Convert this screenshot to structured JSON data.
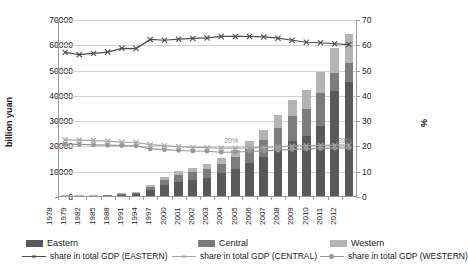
{
  "chart_data": {
    "type": "bar",
    "subtype": "stacked-bar-with-lines",
    "title": "",
    "xlabel": "",
    "ylabel": "billion yuan",
    "ylabel_secondary": "%",
    "ylim": [
      0,
      70000
    ],
    "yticks": [
      0,
      10000,
      20000,
      30000,
      40000,
      50000,
      60000,
      70000
    ],
    "ylim_secondary": [
      0,
      70
    ],
    "yticks_secondary": [
      0,
      10,
      20,
      30,
      40,
      50,
      60,
      70
    ],
    "grid": true,
    "legend_position": "bottom",
    "categories": [
      "1978",
      "1979",
      "1982",
      "1985",
      "1988",
      "1991",
      "1994",
      "1997",
      "2000",
      "2001",
      "2002",
      "2003",
      "2004",
      "2005",
      "2006",
      "2007",
      "2008",
      "2009",
      "2010",
      "2011",
      "2012"
    ],
    "series": [
      {
        "name": "Eastern",
        "kind": "bar",
        "axis": "left",
        "color": "#595959",
        "values": [
          170,
          190,
          260,
          430,
          800,
          1150,
          2800,
          4600,
          6100,
          6800,
          7700,
          9300,
          11100,
          13300,
          15800,
          19000,
          22000,
          24000,
          28000,
          42000,
          45500
        ]
      },
      {
        "name": "Central",
        "kind": "bar",
        "axis": "left",
        "color": "#7c7c7c",
        "values": [
          90,
          100,
          140,
          230,
          430,
          600,
          1300,
          2000,
          2600,
          2900,
          3200,
          3800,
          4600,
          5500,
          6600,
          8200,
          9900,
          11000,
          13000,
          7000,
          7500
        ]
      },
      {
        "name": "Western",
        "kind": "bar",
        "axis": "left",
        "color": "#b4b4b4",
        "values": [
          60,
          70,
          95,
          150,
          280,
          400,
          800,
          1250,
          1600,
          1800,
          2000,
          2400,
          2900,
          3500,
          4200,
          5200,
          6300,
          7200,
          8500,
          10000,
          11500
        ]
      },
      {
        "name": "share in total GDP (EASTERN)",
        "kind": "line",
        "axis": "right",
        "color": "#4d4d4d",
        "marker": "x",
        "values": [
          57.2,
          56.3,
          56.8,
          57.3,
          58.8,
          58.7,
          62.3,
          62.0,
          62.4,
          62.7,
          62.9,
          63.5,
          63.5,
          63.5,
          63.3,
          62.8,
          62.0,
          61.2,
          61.0,
          60.6,
          60.3
        ]
      },
      {
        "name": "share in total GDP (CENTRAL)",
        "kind": "line",
        "axis": "right",
        "color": "#a5a5a5",
        "marker": "x",
        "values": [
          22.6,
          22.5,
          22.3,
          22.1,
          21.7,
          21.6,
          20.7,
          20.3,
          19.9,
          19.6,
          19.5,
          19.3,
          19.3,
          19.4,
          19.6,
          19.8,
          20.1,
          20.3,
          20.4,
          20.5,
          20.6
        ]
      },
      {
        "name": "share in total GDP (WESTERN)",
        "kind": "line",
        "axis": "right",
        "color": "#969696",
        "marker": "circle",
        "values": [
          20.9,
          20.8,
          20.6,
          20.5,
          20.3,
          20.2,
          19.0,
          18.7,
          18.4,
          18.2,
          18.1,
          17.7,
          17.8,
          18.0,
          18.2,
          18.5,
          18.8,
          19.0,
          19.2,
          19.3,
          19.4
        ]
      }
    ],
    "data_labels": [
      {
        "text": "20%",
        "x_index": 11,
        "axis": "right",
        "value": 20
      },
      {
        "text": "20%",
        "x_index": 19,
        "axis": "right",
        "value": 20
      }
    ]
  },
  "legend": {
    "bars": [
      {
        "label": "Eastern",
        "color": "#595959"
      },
      {
        "label": "Central",
        "color": "#7c7c7c"
      },
      {
        "label": "Western",
        "color": "#b4b4b4"
      }
    ],
    "lines": [
      {
        "label": "share in total GDP (EASTERN)",
        "color": "#4d4d4d",
        "marker": "x"
      },
      {
        "label": "share in total GDP (CENTRAL)",
        "color": "#a5a5a5",
        "marker": "x"
      },
      {
        "label": "share in total GDP (WESTERN)",
        "color": "#969696",
        "marker": "circle"
      }
    ]
  }
}
